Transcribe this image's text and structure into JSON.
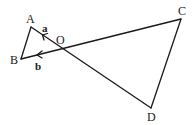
{
  "diagram": {
    "title": "",
    "points": {
      "A": {
        "label": "A",
        "x": 31,
        "y": 27
      },
      "B": {
        "label": "B",
        "x": 21,
        "y": 59
      },
      "O": {
        "label": "O",
        "x": 61,
        "y": 47
      },
      "C": {
        "label": "C",
        "x": 181,
        "y": 19
      },
      "D": {
        "label": "D",
        "x": 151,
        "y": 108
      }
    },
    "segments": [
      {
        "from": "A",
        "to": "B"
      },
      {
        "from": "A",
        "to": "D",
        "through": "O"
      },
      {
        "from": "B",
        "to": "C",
        "through": "O"
      },
      {
        "from": "C",
        "to": "D"
      }
    ],
    "vectors": {
      "a": {
        "label": "a",
        "from": "O",
        "to": "A"
      },
      "b": {
        "label": "b",
        "from": "O",
        "to": "B"
      }
    },
    "colors": {
      "stroke": "#1a1a1a",
      "background": "#ffffff"
    }
  }
}
